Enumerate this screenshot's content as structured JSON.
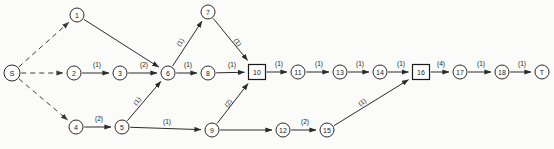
{
  "diagram": {
    "type": "directed-activity-network",
    "title": "",
    "canvas": {
      "width": 554,
      "height": 149,
      "background": "#fbfbfa"
    },
    "colors": {
      "node_stroke": "#2b2b2b",
      "node_fill": "#ffffff",
      "edge_stroke": "#2b2b2b",
      "text": "#1a1a1a"
    },
    "nodes": [
      {
        "id": "S",
        "label": "S",
        "shape": "circle",
        "x": 12,
        "y": 73,
        "r": 8
      },
      {
        "id": "1",
        "label": "1",
        "shape": "circle",
        "x": 77,
        "y": 15,
        "r": 7
      },
      {
        "id": "2",
        "label": "2",
        "shape": "circle",
        "x": 74,
        "y": 73,
        "r": 7
      },
      {
        "id": "3",
        "label": "3",
        "shape": "circle",
        "x": 120,
        "y": 73,
        "r": 7
      },
      {
        "id": "4",
        "label": "4",
        "shape": "circle",
        "x": 76,
        "y": 127,
        "r": 7
      },
      {
        "id": "5",
        "label": "5",
        "shape": "circle",
        "x": 122,
        "y": 127,
        "r": 7
      },
      {
        "id": "6",
        "label": "6",
        "shape": "circle",
        "x": 168,
        "y": 73,
        "r": 7
      },
      {
        "id": "7",
        "label": "7",
        "shape": "circle",
        "x": 208,
        "y": 12,
        "r": 7
      },
      {
        "id": "8",
        "label": "8",
        "shape": "circle",
        "x": 208,
        "y": 73,
        "r": 7
      },
      {
        "id": "9",
        "label": "9",
        "shape": "circle",
        "x": 212,
        "y": 130,
        "r": 7
      },
      {
        "id": "10",
        "label": "10",
        "shape": "square",
        "x": 257,
        "y": 72,
        "w": 17,
        "h": 15
      },
      {
        "id": "11",
        "label": "11",
        "shape": "circle",
        "x": 298,
        "y": 72,
        "r": 7
      },
      {
        "id": "12",
        "label": "12",
        "shape": "circle",
        "x": 283,
        "y": 130,
        "r": 7
      },
      {
        "id": "13",
        "label": "13",
        "shape": "circle",
        "x": 340,
        "y": 72,
        "r": 7
      },
      {
        "id": "14",
        "label": "14",
        "shape": "circle",
        "x": 380,
        "y": 72,
        "r": 7
      },
      {
        "id": "15",
        "label": "15",
        "shape": "circle",
        "x": 327,
        "y": 130,
        "r": 7
      },
      {
        "id": "16",
        "label": "16",
        "shape": "square",
        "x": 421,
        "y": 72,
        "w": 17,
        "h": 15
      },
      {
        "id": "17",
        "label": "17",
        "shape": "circle",
        "x": 460,
        "y": 72,
        "r": 7
      },
      {
        "id": "18",
        "label": "18",
        "shape": "circle",
        "x": 502,
        "y": 72,
        "r": 7
      },
      {
        "id": "T",
        "label": "T",
        "shape": "circle",
        "x": 542,
        "y": 72,
        "r": 7
      }
    ],
    "edges": [
      {
        "from": "S",
        "to": "1",
        "label": "",
        "style": "dashed",
        "lx": 0,
        "ly": 0,
        "rot": 0
      },
      {
        "from": "S",
        "to": "2",
        "label": "",
        "style": "dashed",
        "lx": 0,
        "ly": 0,
        "rot": 0
      },
      {
        "from": "S",
        "to": "4",
        "label": "",
        "style": "dashed",
        "lx": 0,
        "ly": 0,
        "rot": 0
      },
      {
        "from": "1",
        "to": "6",
        "label": "",
        "style": "solid",
        "lx": 0,
        "ly": 0,
        "rot": 0
      },
      {
        "from": "2",
        "to": "3",
        "label": "(1)",
        "style": "solid",
        "lx": 97,
        "ly": 64,
        "rot": 0
      },
      {
        "from": "3",
        "to": "6",
        "label": "(2)",
        "style": "solid",
        "lx": 144,
        "ly": 64,
        "rot": 0
      },
      {
        "from": "4",
        "to": "5",
        "label": "(2)",
        "style": "solid",
        "lx": 99,
        "ly": 118,
        "rot": 0
      },
      {
        "from": "5",
        "to": "6",
        "label": "(1)",
        "style": "solid",
        "lx": 137,
        "ly": 101,
        "rot": -52
      },
      {
        "from": "5",
        "to": "9",
        "label": "(1)",
        "style": "solid",
        "lx": 167,
        "ly": 121,
        "rot": 0
      },
      {
        "from": "6",
        "to": "7",
        "label": "(1)",
        "style": "solid",
        "lx": 180,
        "ly": 42,
        "rot": -55
      },
      {
        "from": "6",
        "to": "8",
        "label": "(1)",
        "style": "solid",
        "lx": 188,
        "ly": 64,
        "rot": 0
      },
      {
        "from": "7",
        "to": "10",
        "label": "(1)",
        "style": "solid",
        "lx": 238,
        "ly": 42,
        "rot": 55
      },
      {
        "from": "8",
        "to": "10",
        "label": "(1)",
        "style": "solid",
        "lx": 232,
        "ly": 64,
        "rot": 0
      },
      {
        "from": "9",
        "to": "10",
        "label": "(2)",
        "style": "solid",
        "lx": 228,
        "ly": 103,
        "rot": -55
      },
      {
        "from": "9",
        "to": "12",
        "label": "",
        "style": "solid",
        "lx": 0,
        "ly": 0,
        "rot": 0
      },
      {
        "from": "10",
        "to": "11",
        "label": "(1)",
        "style": "solid",
        "lx": 279,
        "ly": 63,
        "rot": 0
      },
      {
        "from": "11",
        "to": "13",
        "label": "(1)",
        "style": "solid",
        "lx": 319,
        "ly": 63,
        "rot": 0
      },
      {
        "from": "12",
        "to": "15",
        "label": "(2)",
        "style": "solid",
        "lx": 305,
        "ly": 121,
        "rot": 0
      },
      {
        "from": "13",
        "to": "14",
        "label": "(1)",
        "style": "solid",
        "lx": 360,
        "ly": 63,
        "rot": 0
      },
      {
        "from": "14",
        "to": "16",
        "label": "(1)",
        "style": "solid",
        "lx": 401,
        "ly": 63,
        "rot": 0
      },
      {
        "from": "15",
        "to": "16",
        "label": "(1)",
        "style": "solid",
        "lx": 362,
        "ly": 102,
        "rot": -36
      },
      {
        "from": "16",
        "to": "17",
        "label": "(4)",
        "style": "solid",
        "lx": 441,
        "ly": 63,
        "rot": 0
      },
      {
        "from": "17",
        "to": "18",
        "label": "(1)",
        "style": "solid",
        "lx": 481,
        "ly": 63,
        "rot": 0
      },
      {
        "from": "18",
        "to": "T",
        "label": "(1)",
        "style": "solid",
        "lx": 522,
        "ly": 63,
        "rot": 0
      }
    ]
  }
}
